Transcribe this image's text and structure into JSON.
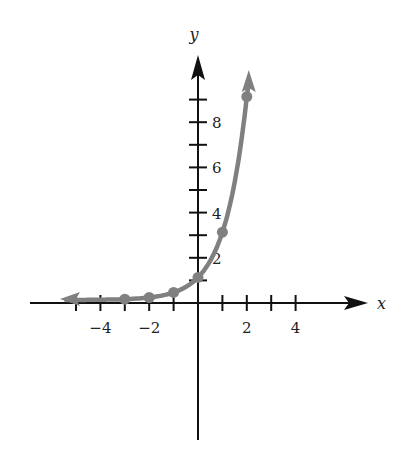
{
  "chart_data": {
    "type": "line",
    "title": "",
    "xlabel": "x",
    "ylabel": "y",
    "function": "y = 3^x",
    "points": [
      {
        "x": -3,
        "y": 0.037
      },
      {
        "x": -2,
        "y": 0.111
      },
      {
        "x": -1,
        "y": 0.333
      },
      {
        "x": 0,
        "y": 1
      },
      {
        "x": 1,
        "y": 3
      },
      {
        "x": 2,
        "y": 9
      }
    ],
    "x_ticks": [
      -5,
      -4,
      -3,
      -2,
      -1,
      1,
      2,
      3,
      4
    ],
    "x_tick_labels": [
      {
        "v": -4,
        "t": "−4"
      },
      {
        "v": -2,
        "t": "−2"
      },
      {
        "v": 2,
        "t": "2"
      },
      {
        "v": 4,
        "t": "4"
      }
    ],
    "y_ticks": [
      1,
      2,
      3,
      4,
      5,
      6,
      7,
      8,
      9
    ],
    "y_tick_labels": [
      {
        "v": 2,
        "t": "2"
      },
      {
        "v": 4,
        "t": "4"
      },
      {
        "v": 6,
        "t": "6"
      },
      {
        "v": 8,
        "t": "8"
      }
    ],
    "xlim": [
      -6,
      7
    ],
    "ylim": [
      -6,
      10
    ],
    "grid": false,
    "curve_color": "#808080",
    "axis_color": "#111111"
  }
}
